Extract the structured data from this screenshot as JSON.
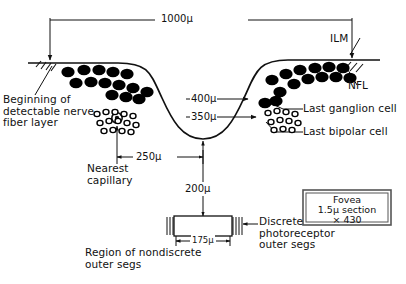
{
  "figure": {
    "caption_box": {
      "line1": "Fovea",
      "line2": "1.5μ section",
      "line3": "× 430"
    }
  },
  "dimensions": {
    "width_total": "1000μ",
    "depth_outer": "400μ",
    "depth_inner": "350μ",
    "capillary_distance": "250μ",
    "pit_to_receptor": "200μ",
    "receptor_width": "175μ"
  },
  "labels": {
    "nerve_fiber_start": "Beginning of\ndetectable nerve\nfiber layer",
    "nearest_capillary": "Nearest\ncapillary",
    "ilm": "ILM",
    "nfl": "NFL",
    "last_ganglion": "Last ganglion cell",
    "last_bipolar": "Last bipolar cell",
    "discrete_photoreceptor": "Discrete\nphotoreceptor\nouter segs",
    "nondiscrete_region": "Region of nondiscrete\nouter segs"
  },
  "colors": {
    "ink": "#111111",
    "cell_fill": "#000000",
    "paper": "#ffffff",
    "rule": "#444444"
  },
  "cells": {
    "ganglion_left": [
      [
        68,
        72
      ],
      [
        84,
        70
      ],
      [
        99,
        70
      ],
      [
        113,
        72
      ],
      [
        127,
        74
      ],
      [
        76,
        83
      ],
      [
        91,
        82
      ],
      [
        105,
        83
      ],
      [
        119,
        85
      ],
      [
        133,
        88
      ],
      [
        112,
        95
      ],
      [
        126,
        97
      ],
      [
        139,
        99
      ],
      [
        147,
        92
      ]
    ],
    "ganglion_right": [
      [
        272,
        80
      ],
      [
        286,
        74
      ],
      [
        300,
        70
      ],
      [
        315,
        68
      ],
      [
        329,
        67
      ],
      [
        343,
        68
      ],
      [
        280,
        92
      ],
      [
        294,
        84
      ],
      [
        308,
        79
      ],
      [
        322,
        77
      ],
      [
        336,
        77
      ],
      [
        350,
        78
      ],
      [
        265,
        103
      ],
      [
        276,
        101
      ]
    ],
    "bipolar_left": [
      [
        97,
        114
      ],
      [
        106,
        112
      ],
      [
        115,
        112
      ],
      [
        124,
        114
      ],
      [
        133,
        116
      ],
      [
        100,
        123
      ],
      [
        109,
        121
      ],
      [
        118,
        121
      ],
      [
        127,
        123
      ],
      [
        136,
        125
      ],
      [
        104,
        131
      ],
      [
        113,
        130
      ],
      [
        122,
        131
      ],
      [
        131,
        132
      ]
    ],
    "bipolar_right": [
      [
        268,
        113
      ],
      [
        277,
        111
      ],
      [
        286,
        112
      ],
      [
        295,
        114
      ],
      [
        271,
        122
      ],
      [
        280,
        120
      ],
      [
        289,
        121
      ],
      [
        298,
        123
      ],
      [
        274,
        130
      ],
      [
        283,
        129
      ],
      [
        292,
        130
      ]
    ]
  }
}
